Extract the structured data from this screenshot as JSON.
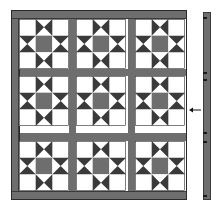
{
  "diagram": {
    "type": "quilt-assembly",
    "pattern": "Ohio Star",
    "grid": {
      "rows": 3,
      "cols": 3
    },
    "colors": {
      "sashing": "#6e6e6e",
      "dark": "#3a3a3a",
      "medium": "#6e6e6e",
      "light": "#ffffff",
      "outline": "#2a2a2a"
    },
    "block_origins_x": [
      19,
      76,
      135
    ],
    "block_origins_y": [
      19,
      76,
      141
    ],
    "right_border": {
      "tick_positions_y": [
        5,
        60,
        67,
        120,
        129,
        183
      ]
    },
    "arrow": {
      "direction": "left",
      "label": ""
    }
  }
}
